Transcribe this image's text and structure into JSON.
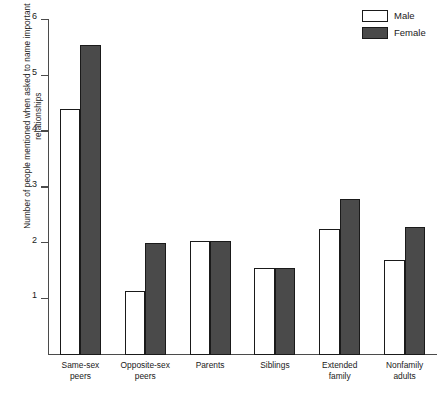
{
  "legend": {
    "items": [
      {
        "label": "Male",
        "color": "#ffffff",
        "swatch": "male"
      },
      {
        "label": "Female",
        "color": "#4a4a4a",
        "swatch": "female"
      }
    ]
  },
  "axis": {
    "ylabel": "Number of people mentioned when asked to name important relationships",
    "yticks": [
      "1",
      "2",
      "3",
      "4",
      "5",
      "6"
    ]
  },
  "categories_display": [
    "Same-sex\npeers",
    "Opposite-sex\npeers",
    "Parents",
    "Siblings",
    "Extended\nfamily",
    "Nonfamily\nadults"
  ],
  "chart_data": {
    "type": "bar",
    "title": "",
    "xlabel": "",
    "ylabel": "Number of people mentioned when asked to name important relationships",
    "categories": [
      "Same-sex peers",
      "Opposite-sex peers",
      "Parents",
      "Siblings",
      "Extended family",
      "Nonfamily adults"
    ],
    "series": [
      {
        "name": "Male",
        "color": "#ffffff",
        "values": [
          4.4,
          1.15,
          2.05,
          1.55,
          2.25,
          1.7
        ]
      },
      {
        "name": "Female",
        "color": "#4a4a4a",
        "values": [
          5.55,
          2.0,
          2.05,
          1.55,
          2.8,
          2.3
        ]
      }
    ],
    "ylim": [
      0,
      6
    ],
    "yticks": [
      1,
      2,
      3,
      4,
      5,
      6
    ],
    "grid": false,
    "legend_position": "top-right"
  }
}
